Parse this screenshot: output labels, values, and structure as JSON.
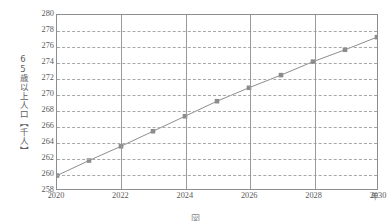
{
  "chart_data": {
    "type": "line",
    "title": "",
    "xlabel": "年",
    "ylabel": "65歳以上人口【千人】",
    "x": [
      2020,
      2021,
      2022,
      2023,
      2024,
      2025,
      2026,
      2027,
      2028,
      2029,
      2030
    ],
    "values": [
      259.7,
      261.6,
      263.4,
      265.3,
      267.2,
      269.1,
      270.8,
      272.4,
      274.1,
      275.6,
      277.2
    ],
    "series": [
      {
        "name": "65歳以上人口",
        "values": [
          259.7,
          261.6,
          263.4,
          265.3,
          267.2,
          269.1,
          270.8,
          272.4,
          274.1,
          275.6,
          277.2
        ]
      }
    ],
    "xlim": [
      2020,
      2030
    ],
    "ylim": [
      258,
      280
    ],
    "ytick_step": 2,
    "yticks": [
      280,
      278,
      276,
      274,
      272,
      270,
      268,
      266,
      264,
      262,
      260,
      258
    ],
    "ytick_labels": [
      "280",
      "278",
      "276",
      "274",
      "272",
      "270",
      "268",
      "266",
      "264",
      "262",
      "260",
      "258"
    ],
    "xticks": [
      2020,
      2022,
      2024,
      2026,
      2028,
      2030
    ],
    "xtick_labels": [
      "2020",
      "2022",
      "2024",
      "2026",
      "2028",
      "2030"
    ],
    "grid": {
      "horizontal": "dashed",
      "vertical": "solid",
      "horizontal_every": 2,
      "vertical_every": 2
    },
    "legend": null,
    "marker": "square",
    "colors": {
      "line": "#8c8c8c",
      "marker": "#8c8c8c",
      "frame": "#8d8d8d",
      "hgrid": "#a8a8a8",
      "vgrid": "#9a9a9a",
      "text": "#5a5a5a",
      "background": "#ffffff"
    }
  },
  "axis": {
    "y_title": "65歳以上人口【千人】",
    "x_unit": "年"
  },
  "caption": {
    "text": "図"
  }
}
